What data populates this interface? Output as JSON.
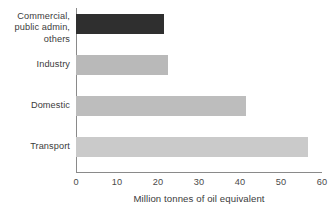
{
  "chart_data": {
    "type": "bar",
    "orientation": "horizontal",
    "title": "",
    "xlabel": "Million tonnes of oil equivalent",
    "ylabel": "",
    "categories": [
      "Commercial,\npublic admin,\nothers",
      "Industry",
      "Domestic",
      "Transport"
    ],
    "values": [
      21.5,
      22.5,
      41.5,
      56.5
    ],
    "xlim": [
      0,
      60
    ],
    "xticks": [
      0,
      10,
      20,
      30,
      40,
      50,
      60
    ],
    "xtick_labels": [
      "0",
      "10",
      "20",
      "30",
      "40",
      "50",
      "60"
    ],
    "grid": false,
    "legend": false,
    "bar_colors": [
      "#2f2f2f",
      "#b9b9b9",
      "#bdbdbd",
      "#cacaca"
    ]
  },
  "axis": {
    "line_color": "#8a8a8a",
    "text_color": "#3b3b3b"
  }
}
